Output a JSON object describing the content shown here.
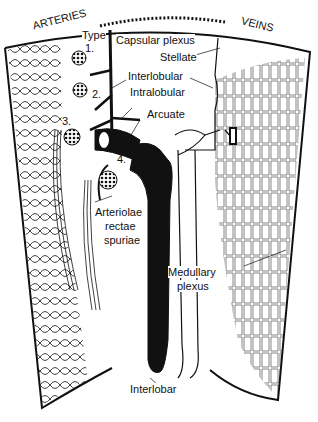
{
  "diagram": {
    "sections": {
      "left": "ARTERIES",
      "right": "VEINS"
    },
    "labels": {
      "type": "Type",
      "type1": "1.",
      "type2": "2.",
      "type3": "3.",
      "type4": "4.",
      "capsular_plexus": "Capsular plexus",
      "stellate": "Stellate",
      "interlobular": "Interlobular",
      "intralobular": "Intralobular",
      "arcuate": "Arcuate",
      "arteriolae_1": "Arteriolae",
      "arteriolae_2": "rectae",
      "arteriolae_3": "spuriae",
      "medullary_1": "Medullary",
      "medullary_2": "plexus",
      "interlobar": "Interlobar"
    },
    "colors": {
      "ink": "#111111",
      "paper": "#ffffff"
    }
  }
}
